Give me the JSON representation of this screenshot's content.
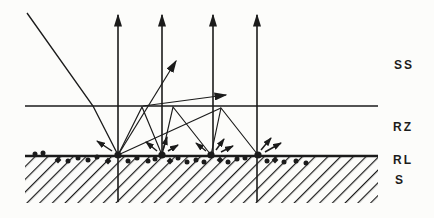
{
  "figure": {
    "ink_color": "#1b1b1b",
    "background_color": "#fcfcfa",
    "labels": {
      "ss": "SS",
      "rz": "RZ",
      "rl": "RL",
      "s": "S"
    },
    "geometry": {
      "canvas": {
        "width": 434,
        "height": 218
      },
      "region": {
        "left": 25,
        "right": 378,
        "rz_line_y": 106,
        "surface_y": 156,
        "hatch_bottom_y": 203
      },
      "incident_beam": [
        [
          27,
          13
        ],
        [
          93,
          106
        ],
        [
          118,
          155
        ]
      ],
      "vertical_arrows": [
        {
          "x": 118,
          "y_from": 202,
          "y_to": 15
        },
        {
          "x": 162,
          "y_from": 155,
          "y_to": 15
        },
        {
          "x": 213,
          "y_from": 155,
          "y_to": 15
        },
        {
          "x": 257,
          "y_from": 202,
          "y_to": 15
        }
      ],
      "bounce_paths": [
        [
          [
            118,
            155
          ],
          [
            142,
            107
          ],
          [
            162,
            155
          ]
        ],
        [
          [
            162,
            155
          ],
          [
            173,
            107
          ],
          [
            211,
            155
          ]
        ],
        [
          [
            211,
            155
          ],
          [
            221,
            108
          ],
          [
            258,
            155
          ]
        ],
        [
          [
            118,
            155
          ],
          [
            221,
            108
          ]
        ]
      ],
      "escape_arrows": [
        [
          [
            118,
            155
          ],
          [
            176,
            61
          ]
        ],
        [
          [
            143,
            106
          ],
          [
            226,
            95
          ]
        ]
      ],
      "sputter_arrows": [
        [
          [
            112,
            151
          ],
          [
            97,
            141
          ]
        ],
        [
          [
            157,
            151
          ],
          [
            146,
            142
          ]
        ],
        [
          [
            163,
            150
          ],
          [
            167,
            137
          ]
        ],
        [
          [
            168,
            151
          ],
          [
            178,
            145
          ]
        ],
        [
          [
            206,
            151
          ],
          [
            196,
            143
          ]
        ],
        [
          [
            216,
            150
          ],
          [
            224,
            139
          ]
        ],
        [
          [
            221,
            152
          ],
          [
            233,
            146
          ]
        ],
        [
          [
            261,
            150
          ],
          [
            271,
            138
          ]
        ],
        [
          [
            265,
            152
          ],
          [
            281,
            143
          ]
        ]
      ],
      "impact_dots": [
        [
          118,
          155
        ],
        [
          162,
          155
        ],
        [
          211,
          155
        ],
        [
          258,
          155
        ]
      ],
      "surface_dots": [
        [
          35,
          154
        ],
        [
          43,
          153
        ],
        [
          58,
          160
        ],
        [
          68,
          161
        ],
        [
          78,
          158
        ],
        [
          88,
          160
        ],
        [
          97,
          157
        ],
        [
          108,
          161
        ],
        [
          128,
          161
        ],
        [
          137,
          158
        ],
        [
          148,
          161
        ],
        [
          155,
          159
        ],
        [
          170,
          161
        ],
        [
          178,
          158
        ],
        [
          187,
          162
        ],
        [
          196,
          160
        ],
        [
          204,
          162
        ],
        [
          220,
          160
        ],
        [
          228,
          162
        ],
        [
          237,
          159
        ],
        [
          245,
          158
        ],
        [
          267,
          161
        ],
        [
          275,
          160
        ],
        [
          284,
          162
        ],
        [
          296,
          161
        ],
        [
          306,
          163
        ]
      ]
    }
  }
}
